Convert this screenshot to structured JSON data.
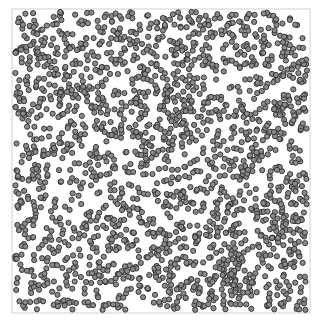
{
  "chart_data": {
    "type": "scatter",
    "title": "",
    "xlabel": "",
    "ylabel": "",
    "xlim": [
      0,
      100
    ],
    "ylim": [
      0,
      100
    ],
    "grid": false,
    "legend": null,
    "axes_visible": false,
    "frame": {
      "x": 12,
      "y": 9,
      "width": 298,
      "height": 304,
      "color": "#d0d0d0"
    },
    "marker": {
      "shape": "circle",
      "radius": 2.6,
      "fill": "#8a8a8a",
      "stroke": "#2e2e2e",
      "stroke_width": 0.9
    },
    "approx_point_count": 2000,
    "distribution": "uniform random over the full plot area",
    "generator": {
      "seed": 12345,
      "count": 2000
    }
  }
}
